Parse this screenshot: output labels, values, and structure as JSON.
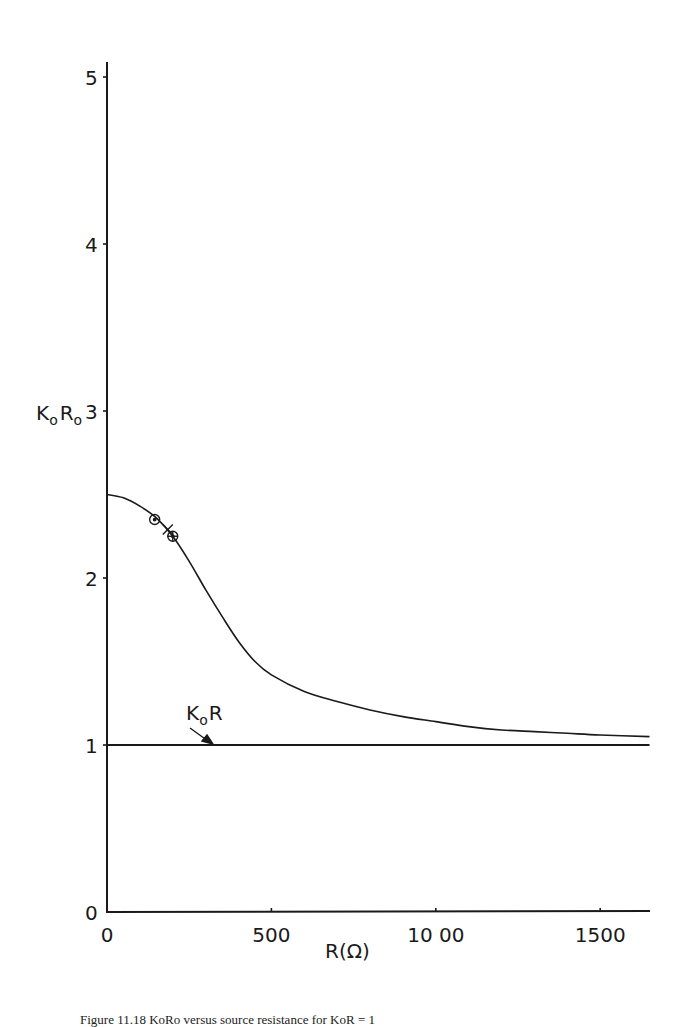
{
  "chart_data": {
    "type": "line",
    "title": "",
    "xlabel": "R(Ω)",
    "ylabel": "KoRo",
    "xlim": [
      0,
      1650
    ],
    "ylim": [
      0,
      5
    ],
    "grid": false,
    "legend": "none",
    "x_ticks": [
      0,
      500,
      1000,
      1500
    ],
    "x_tick_labels": [
      "0",
      "500",
      "10 00",
      "1500"
    ],
    "y_ticks": [
      0,
      1,
      2,
      3,
      4,
      5
    ],
    "y_tick_labels": [
      "0",
      "1",
      "2",
      "3",
      "4",
      "5"
    ],
    "series": [
      {
        "name": "KoRo",
        "style": "solid-curve",
        "x": [
          0,
          50,
          100,
          150,
          200,
          250,
          300,
          350,
          400,
          450,
          500,
          600,
          700,
          800,
          900,
          1000,
          1100,
          1200,
          1300,
          1400,
          1500,
          1650
        ],
        "y": [
          2.5,
          2.48,
          2.43,
          2.36,
          2.25,
          2.1,
          1.93,
          1.77,
          1.62,
          1.5,
          1.42,
          1.32,
          1.26,
          1.21,
          1.17,
          1.14,
          1.11,
          1.09,
          1.08,
          1.07,
          1.06,
          1.05
        ]
      },
      {
        "name": "KoR",
        "style": "horizontal-line",
        "x": [
          0,
          1650
        ],
        "y": [
          1.0,
          1.0
        ]
      }
    ],
    "markers": [
      {
        "type": "circle",
        "x": 145,
        "y": 2.35
      },
      {
        "type": "cross",
        "x": 185,
        "y": 2.29
      },
      {
        "type": "circle-plus",
        "x": 200,
        "y": 2.25
      }
    ],
    "annotations": [
      {
        "text": "KoR",
        "x": 230,
        "y": 1.28,
        "arrow_to": [
          320,
          1.01
        ]
      }
    ]
  },
  "labels": {
    "y_axis_main": "K",
    "y_axis_sub1": "o",
    "y_axis_mid": "R",
    "y_axis_sub2": "o",
    "x_axis": "R(Ω)",
    "annotation_K": "K",
    "annotation_sub": "o",
    "annotation_R": "R"
  },
  "caption": {
    "figure_label": "Figure 11.18",
    "text": "KoRo versus source resistance for KoR = 1"
  }
}
